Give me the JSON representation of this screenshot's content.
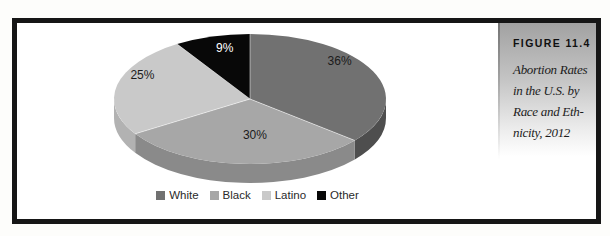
{
  "figure": {
    "label": "FIGURE 11.4",
    "caption_lines": [
      "Abortion Rates",
      "in the U.S. by",
      "Race and Eth-",
      "nicity, 2012"
    ]
  },
  "chart_data": {
    "type": "pie",
    "style": "3d",
    "labels": [
      "White",
      "Black",
      "Latino",
      "Other"
    ],
    "values": [
      36,
      30,
      25,
      9
    ],
    "value_labels": [
      "36%",
      "30%",
      "25%",
      "9%"
    ],
    "colors": [
      "#717171",
      "#a7a7a7",
      "#c9c9c9",
      "#080808"
    ],
    "side_colors": [
      "#4e4e4e",
      "#8a8a8a",
      "#b2b2b2",
      "#000000"
    ],
    "value_label_colors": [
      "#1b1b1b",
      "#1b1b1b",
      "#1b1b1b",
      "#ffffff"
    ],
    "start_angle_deg": 0,
    "direction": "clockwise",
    "legend_position": "bottom"
  }
}
